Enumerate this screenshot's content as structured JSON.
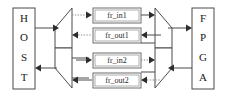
{
  "diagram": {
    "background_color": "#ffffff",
    "line_color": "#4a4a4a",
    "dotted_line_color": "#8d8d8d",
    "text_color": "#1a1a1a",
    "endpoints": {
      "host": {
        "name": "HOST",
        "letters": [
          "H",
          "O",
          "S",
          "T"
        ]
      },
      "fpga": {
        "name": "FPGA",
        "letters": [
          "F",
          "P",
          "G",
          "A"
        ]
      }
    },
    "buffers": [
      {
        "label": "fr_in1",
        "direction": "host-to-fpga"
      },
      {
        "label": "fr_out1",
        "direction": "fpga-to-host"
      },
      {
        "label": "fr_in2",
        "direction": "host-to-fpga"
      },
      {
        "label": "fr_out2",
        "direction": "fpga-to-host"
      }
    ],
    "muxes": [
      {
        "name": "left-upper-mux",
        "side": "left",
        "position": "upper"
      },
      {
        "name": "left-lower-mux",
        "side": "left",
        "position": "lower"
      },
      {
        "name": "right-upper-mux",
        "side": "right",
        "position": "upper"
      },
      {
        "name": "right-lower-mux",
        "side": "right",
        "position": "lower"
      }
    ],
    "connections": [
      {
        "from": "HOST",
        "to": "left-upper-mux",
        "style": "solid",
        "arrow": "right"
      },
      {
        "from": "left-lower-mux",
        "to": "HOST",
        "style": "solid",
        "arrow": "left"
      },
      {
        "from": "left-upper-mux",
        "to": "fr_in1",
        "style": "dotted",
        "arrow": "right"
      },
      {
        "from": "fr_out1",
        "to": "left-upper-mux",
        "style": "dotted",
        "arrow": "left"
      },
      {
        "from": "left-lower-mux",
        "to": "fr_in2",
        "style": "solid",
        "arrow": "right"
      },
      {
        "from": "fr_out2",
        "to": "left-lower-mux",
        "style": "solid",
        "arrow": "left"
      },
      {
        "from": "fr_in1",
        "to": "right-upper-mux",
        "style": "solid",
        "arrow": "right"
      },
      {
        "from": "right-upper-mux",
        "to": "fr_out1",
        "style": "solid",
        "arrow": "left"
      },
      {
        "from": "fr_in2",
        "to": "right-lower-mux",
        "style": "dotted",
        "arrow": "right"
      },
      {
        "from": "right-lower-mux",
        "to": "fr_out2",
        "style": "dotted",
        "arrow": "left"
      },
      {
        "from": "right-upper-mux",
        "to": "FPGA",
        "style": "solid",
        "arrow": "right"
      },
      {
        "from": "FPGA",
        "to": "right-lower-mux",
        "style": "solid",
        "arrow": "left"
      }
    ]
  }
}
